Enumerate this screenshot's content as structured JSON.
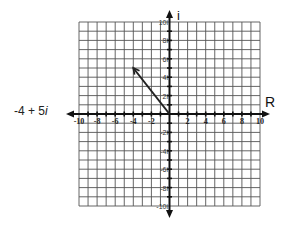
{
  "chart_data": {
    "type": "scatter",
    "title": "",
    "xlabel": "R",
    "ylabel": "i",
    "xlim": [
      -10,
      10
    ],
    "ylim": [
      -10,
      10
    ],
    "grid": true,
    "x_ticks": [
      "-10",
      "-8",
      "-6",
      "-4",
      "-2",
      "2",
      "4",
      "6",
      "8",
      "10"
    ],
    "y_ticks": [
      "10i",
      "8i",
      "6i",
      "4i",
      "2i",
      "-2i",
      "-4i",
      "-6i",
      "-8i",
      "-10i"
    ],
    "series": [
      {
        "name": "-4 + 5i",
        "kind": "vector",
        "from": [
          0,
          0
        ],
        "to": [
          -4,
          5
        ]
      }
    ],
    "annotations": [
      "-4 + 5i"
    ]
  },
  "label": {
    "real": "-4 + 5",
    "imag_unit": "i"
  },
  "colors": {
    "grid": "#555555",
    "axis": "#111111",
    "vector": "#222222"
  }
}
